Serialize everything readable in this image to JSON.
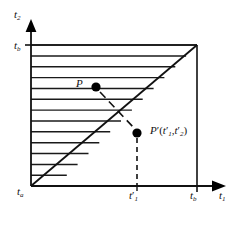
{
  "figure": {
    "caption_type": "mathematical-domain-diagram",
    "background_color": "#ffffff",
    "stroke_color": "#111111"
  },
  "axes": {
    "x_axis_label": "t",
    "x_axis_subscript": "1",
    "y_axis_label": "t",
    "y_axis_subscript": "2",
    "origin_label": "t",
    "origin_subscript": "a",
    "y_top_tick_label": "t",
    "y_top_tick_subscript": "b",
    "x_right_tick_label": "t",
    "x_right_tick_subscript": "b",
    "x_inner_tick_label": "t",
    "x_inner_tick_prime": "′",
    "x_inner_tick_subscript": "1"
  },
  "points": [
    {
      "name": "P",
      "label": "P",
      "region": "hatched-upper-triangle",
      "x_px": 96,
      "y_px": 87
    },
    {
      "name": "P-prime",
      "label": "P",
      "prime": "′",
      "coord_open": "(",
      "coord_t1": "t",
      "coord_t1_prime": "′",
      "coord_t1_sub": "1",
      "coord_comma": ",",
      "coord_t2": "t",
      "coord_t2_prime": "′",
      "coord_t2_sub": "2",
      "coord_close": ")",
      "region": "lower-right-triangle",
      "x_px": 141,
      "y_px": 133
    }
  ],
  "geometry": {
    "origin_x": 31,
    "origin_y": 186,
    "right_x": 197,
    "top_y": 45,
    "tprime_x": 137,
    "hatch_line_count": 13,
    "hatch_spacing_px": 10.85,
    "diagonal_from": "origin",
    "diagonal_to": "top-right-corner",
    "hatched_region": "above-diagonal"
  },
  "annotations": {
    "arrow_from_p_to_pprime": "dashed arrow from P to P-prime crossing the diagonal",
    "drop_line": "dashed vertical line from P-prime down to x-axis at t1-prime"
  }
}
